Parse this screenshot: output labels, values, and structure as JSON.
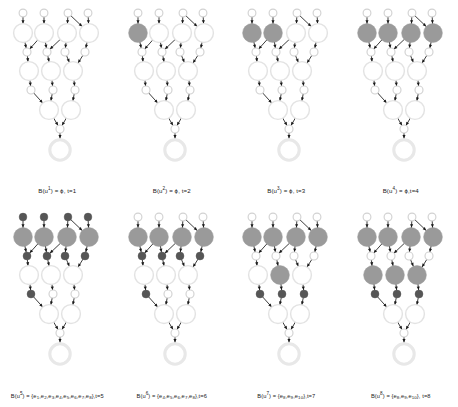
{
  "figure": {
    "type": "diagram",
    "colors": {
      "node_outline": "#e3e3e3",
      "node_outline_dark": "#d2d2d2",
      "node_filled_gray": "#9a9a9a",
      "small_node_dark": "#565656",
      "arrow": "#1a1a1a",
      "root_ring": "#e8e8e8",
      "background": "#ffffff",
      "text": "#1a1a1a"
    },
    "layout": {
      "rows": 2,
      "cols": 4
    }
  },
  "panels": [
    {
      "id": "panel-1",
      "caption_parts": {
        "prefix": "B(u",
        "sup": "1",
        "mid": ") = ϕ, t=",
        "t": "1"
      },
      "caption": "B(u1) = ϕ, t=1",
      "t": 1,
      "boundary_set": "ϕ",
      "filled_big_row1": [],
      "filled_big_row3": [],
      "dark_small_row0": [],
      "dark_small_row2": [],
      "dark_small_row4": []
    },
    {
      "id": "panel-2",
      "caption_parts": {
        "prefix": "B(u",
        "sup": "2",
        "mid": ") = ϕ, t=",
        "t": "2"
      },
      "caption": "B(u2) = ϕ, t=2",
      "t": 2,
      "boundary_set": "ϕ",
      "filled_big_row1": [
        0
      ],
      "filled_big_row3": [],
      "dark_small_row0": [],
      "dark_small_row2": [],
      "dark_small_row4": []
    },
    {
      "id": "panel-3",
      "caption_parts": {
        "prefix": "B(u",
        "sup": "3",
        "mid": ") = ϕ, t=",
        "t": "3"
      },
      "caption": "B(u3) = ϕ, t=3",
      "t": 3,
      "boundary_set": "ϕ",
      "filled_big_row1": [
        0,
        1
      ],
      "filled_big_row3": [],
      "dark_small_row0": [],
      "dark_small_row2": [],
      "dark_small_row4": []
    },
    {
      "id": "panel-4",
      "caption_parts": {
        "prefix": "B(u",
        "sup": "4",
        "mid": ") = ϕ,t=",
        "t": "4"
      },
      "caption": "B(u4) = ϕ,t=4",
      "t": 4,
      "boundary_set": "ϕ",
      "filled_big_row1": [
        0,
        1,
        2,
        3
      ],
      "filled_big_row3": [],
      "dark_small_row0": [],
      "dark_small_row2": [],
      "dark_small_row4": []
    },
    {
      "id": "panel-5",
      "caption_parts": {
        "prefix": "B(u",
        "sup": "5",
        "mid": ") = {",
        "set": [
          "e1",
          "e2",
          "e3",
          "e4",
          "e5",
          "e6",
          "e7",
          "e8"
        ],
        "suffix": "},t=",
        "t": "5"
      },
      "caption": "B(u5) = {e1,e2,e3,e4,e5,e6,e7,e8},t=5",
      "t": 5,
      "boundary_set": "{e1,e2,e3,e4,e5,e6,e7,e8}",
      "filled_big_row1": [
        0,
        1,
        2,
        3
      ],
      "filled_big_row3": [],
      "dark_small_row0": [
        0,
        1,
        2,
        3
      ],
      "dark_small_row2": [
        0,
        1,
        2,
        3
      ],
      "dark_small_row4": [
        0
      ]
    },
    {
      "id": "panel-6",
      "caption_parts": {
        "prefix": "B(u",
        "sup": "6",
        "mid": ") = {",
        "set": [
          "e4",
          "e5",
          "e6",
          "e7",
          "e8"
        ],
        "suffix": "},t=",
        "t": "6"
      },
      "caption": "B(u6) = {e4,e5,e6,e7,e8},t=6",
      "t": 6,
      "boundary_set": "{e4,e5,e6,e7,e8}",
      "filled_big_row1": [
        0,
        1,
        2,
        3
      ],
      "filled_big_row3": [],
      "dark_small_row0": [],
      "dark_small_row2": [
        0,
        1,
        2,
        3
      ],
      "dark_small_row4": [
        0
      ]
    },
    {
      "id": "panel-7",
      "caption_parts": {
        "prefix": "B(u",
        "sup": "7",
        "mid": ") = {",
        "set": [
          "e8",
          "e9",
          "e10"
        ],
        "suffix": "},t=",
        "t": "7"
      },
      "caption": "B(u7) = {e8,e9,e10},t=7",
      "t": 7,
      "boundary_set": "{e8,e9,e10}",
      "filled_big_row1": [
        0,
        1,
        2,
        3
      ],
      "filled_big_row3": [
        1
      ],
      "dark_small_row0": [],
      "dark_small_row2": [],
      "dark_small_row4": [
        0,
        1,
        2
      ]
    },
    {
      "id": "panel-8",
      "caption_parts": {
        "prefix": "B(u",
        "sup": "8",
        "mid": ") = {",
        "set": [
          "e8",
          "e9",
          "e10"
        ],
        "suffix": "}, t=",
        "t": "8"
      },
      "caption": "B(u8) = {e8,e9,e10}, t=8",
      "t": 8,
      "boundary_set": "{e8,e9,e10}",
      "filled_big_row1": [
        0,
        1,
        2,
        3
      ],
      "filled_big_row3": [
        0,
        1,
        2
      ],
      "dark_small_row0": [],
      "dark_small_row2": [],
      "dark_small_row4": [
        0,
        1,
        2
      ]
    }
  ],
  "graph_structure": {
    "levels": [
      {
        "name": "row0-sources",
        "kind": "small",
        "count": 4,
        "x": [
          22,
          43,
          70,
          88
        ],
        "y": 12,
        "r": 4.2
      },
      {
        "name": "row1-big",
        "kind": "big",
        "count": 4,
        "x": [
          22,
          43,
          66,
          89
        ],
        "y": 31,
        "r": 9.6
      },
      {
        "name": "row2-small",
        "kind": "small",
        "count": 4,
        "x": [
          26,
          45,
          64,
          84
        ],
        "y": 50,
        "r": 4.2
      },
      {
        "name": "row3-big",
        "kind": "big",
        "count": 3,
        "x": [
          28,
          50,
          72
        ],
        "y": 69,
        "r": 9.6
      },
      {
        "name": "row4-small",
        "kind": "small",
        "count": 3,
        "x": [
          30,
          52,
          74
        ],
        "y": 88,
        "r": 4.2
      },
      {
        "name": "row5-big",
        "kind": "big",
        "count": 2,
        "x": [
          47,
          69
        ],
        "y": 107,
        "r": 9.6
      },
      {
        "name": "row6-small",
        "kind": "small",
        "count": 1,
        "x": [
          58
        ],
        "y": 126,
        "r": 4.2
      },
      {
        "name": "row7-root",
        "kind": "root",
        "count": 1,
        "x": [
          58
        ],
        "y": 146,
        "r": 10.5
      }
    ]
  }
}
